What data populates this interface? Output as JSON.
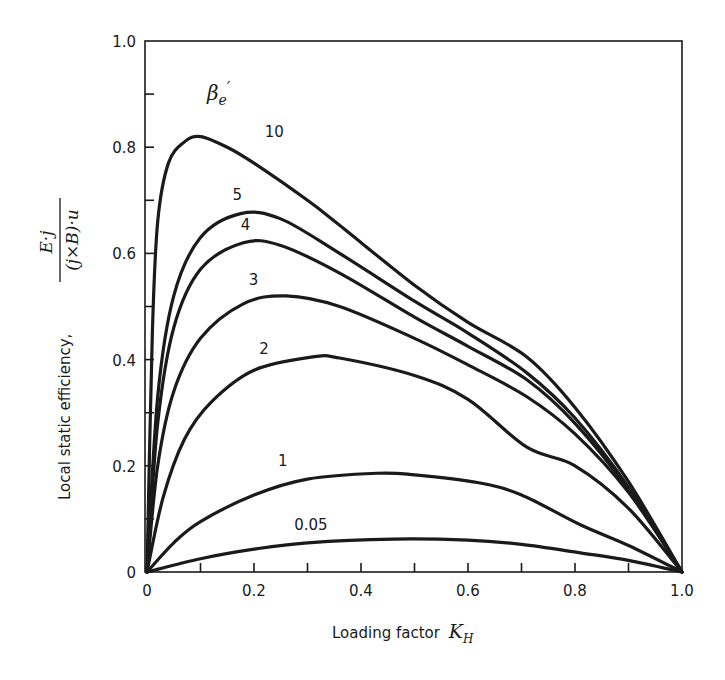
{
  "chart_data": {
    "type": "line",
    "title": "",
    "xlabel": "Loading factor K_H",
    "ylabel": "Local static efficiency, E·j / (j×B)·u",
    "xlim": [
      0,
      1.0
    ],
    "ylim": [
      0,
      1.0
    ],
    "grid": false,
    "legend_title": "β_e'",
    "legend_position": "inline labels on curves",
    "x_ticks": [
      "0",
      "0.2",
      "0.4",
      "0.6",
      "0.8",
      "1.0"
    ],
    "y_ticks": [
      "0",
      "0.2",
      "0.4",
      "0.6",
      "0.8",
      "1.0"
    ],
    "series": [
      {
        "name": "10",
        "x": [
          0,
          0.01,
          0.02,
          0.04,
          0.07,
          0.1,
          0.15,
          0.2,
          0.3,
          0.36,
          0.5,
          0.6,
          0.71,
          0.8,
          0.9,
          1.0
        ],
        "y": [
          0,
          0.45,
          0.66,
          0.77,
          0.81,
          0.82,
          0.8,
          0.77,
          0.7,
          0.653,
          0.54,
          0.47,
          0.405,
          0.31,
          0.17,
          0.0
        ]
      },
      {
        "name": "5",
        "x": [
          0,
          0.02,
          0.05,
          0.1,
          0.175,
          0.25,
          0.36,
          0.5,
          0.6,
          0.71,
          0.8,
          0.9,
          1.0
        ],
        "y": [
          0,
          0.33,
          0.52,
          0.63,
          0.675,
          0.665,
          0.6,
          0.51,
          0.45,
          0.375,
          0.29,
          0.16,
          0.0
        ]
      },
      {
        "name": "4",
        "x": [
          0,
          0.02,
          0.05,
          0.1,
          0.18,
          0.25,
          0.36,
          0.5,
          0.6,
          0.71,
          0.8,
          0.9,
          1.0
        ],
        "y": [
          0,
          0.28,
          0.46,
          0.57,
          0.62,
          0.615,
          0.563,
          0.48,
          0.425,
          0.362,
          0.28,
          0.155,
          0.0
        ]
      },
      {
        "name": "3",
        "x": [
          0,
          0.02,
          0.05,
          0.1,
          0.18,
          0.26,
          0.36,
          0.5,
          0.6,
          0.71,
          0.8,
          0.9,
          1.0
        ],
        "y": [
          0,
          0.2,
          0.34,
          0.44,
          0.505,
          0.52,
          0.5,
          0.44,
          0.39,
          0.33,
          0.26,
          0.15,
          0.0
        ]
      },
      {
        "name": "2",
        "x": [
          0,
          0.03,
          0.07,
          0.12,
          0.2,
          0.31,
          0.36,
          0.5,
          0.6,
          0.71,
          0.8,
          0.9,
          1.0
        ],
        "y": [
          0,
          0.14,
          0.25,
          0.32,
          0.38,
          0.405,
          0.403,
          0.37,
          0.325,
          0.235,
          0.2,
          0.12,
          0.0
        ]
      },
      {
        "name": "1",
        "x": [
          0,
          0.05,
          0.1,
          0.2,
          0.3,
          0.43,
          0.5,
          0.62,
          0.7,
          0.81,
          0.9,
          1.0
        ],
        "y": [
          0,
          0.055,
          0.095,
          0.145,
          0.175,
          0.186,
          0.183,
          0.168,
          0.145,
          0.089,
          0.05,
          0.0
        ]
      },
      {
        "name": "0.05",
        "x": [
          0,
          0.1,
          0.2,
          0.3,
          0.46,
          0.6,
          0.7,
          0.81,
          0.9,
          1.0
        ],
        "y": [
          0,
          0.025,
          0.043,
          0.055,
          0.062,
          0.06,
          0.052,
          0.036,
          0.022,
          0.0
        ]
      }
    ],
    "annotations": [
      {
        "text": "β_e'",
        "x": 0.13,
        "y": 0.92
      },
      {
        "text": "10",
        "x": 0.22,
        "y": 0.82
      },
      {
        "text": "5",
        "x": 0.16,
        "y": 0.7
      },
      {
        "text": "4",
        "x": 0.175,
        "y": 0.645
      },
      {
        "text": "3",
        "x": 0.19,
        "y": 0.54
      },
      {
        "text": "2",
        "x": 0.21,
        "y": 0.41
      },
      {
        "text": "1",
        "x": 0.245,
        "y": 0.2
      },
      {
        "text": "0.05",
        "x": 0.275,
        "y": 0.08
      }
    ]
  },
  "labels": {
    "x_axis_text": "Loading factor",
    "x_axis_symbol": "K",
    "x_axis_subscript": "H",
    "y_axis_text": "Local static efficiency,",
    "y_axis_numerator": "E·j",
    "y_axis_denominator": "(j×B)·u",
    "legend_symbol": "β",
    "legend_subscript": "e",
    "legend_prime": "′"
  }
}
